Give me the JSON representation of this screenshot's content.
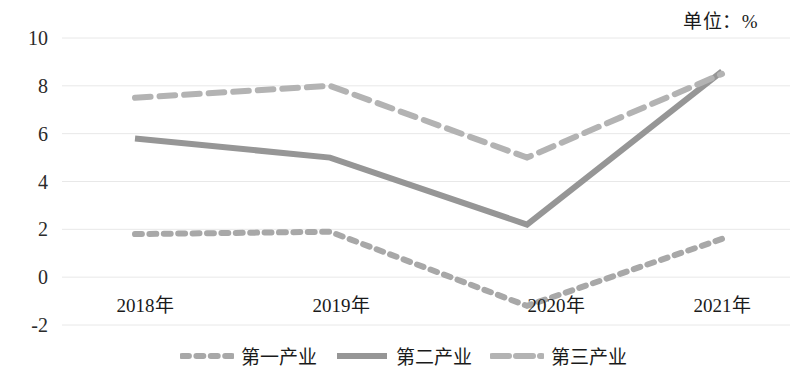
{
  "unit_note": "单位：%",
  "chart_data": {
    "type": "line",
    "title": "",
    "subtitle": "",
    "xlabel": "",
    "ylabel": "",
    "unit": "%",
    "categories": [
      "2018年",
      "2019年",
      "2020年",
      "2021年"
    ],
    "x_tick_labels": [
      "2018年",
      "2019年",
      "2020年",
      "2021年"
    ],
    "y_tick_labels": [
      "10",
      "8",
      "6",
      "4",
      "2",
      "0",
      "-2"
    ],
    "y_ticks": [
      10,
      8,
      6,
      4,
      2,
      0,
      -2
    ],
    "ylim": [
      -2,
      10
    ],
    "grid": true,
    "grid_axis": "y",
    "legend_position": "bottom",
    "series": [
      {
        "name": "第一产业",
        "values": [
          1.8,
          1.9,
          -1.2,
          1.6
        ],
        "style": "dotted",
        "color": "#a8a8a8"
      },
      {
        "name": "第二产业",
        "values": [
          5.8,
          5.0,
          2.2,
          8.6
        ],
        "style": "solid",
        "color": "#969696"
      },
      {
        "name": "第三产业",
        "values": [
          7.5,
          8.0,
          5.0,
          8.5
        ],
        "style": "dashed",
        "color": "#b3b3b3"
      }
    ]
  },
  "legend": {
    "items": [
      {
        "label": "第一产业",
        "color": "#a8a8a8",
        "style": "dotted"
      },
      {
        "label": "第二产业",
        "color": "#969696",
        "style": "solid"
      },
      {
        "label": "第三产业",
        "color": "#b3b3b3",
        "style": "dashed"
      }
    ]
  },
  "axis": {
    "y_labels": [
      "10",
      "8",
      "6",
      "4",
      "2",
      "0",
      "-2"
    ],
    "x_labels": [
      "2018年",
      "2019年",
      "2020年",
      "2021年"
    ]
  },
  "colors": {
    "grid": "#e8e8e8",
    "text": "#1a1a1a",
    "background": "#ffffff"
  }
}
